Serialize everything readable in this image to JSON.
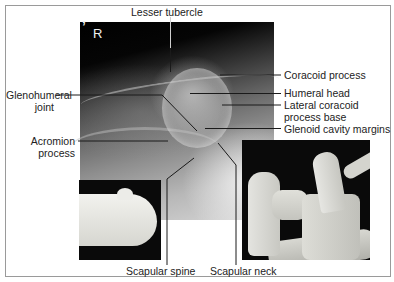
{
  "figure": {
    "type": "anatomical-radiograph-diagram",
    "side_marker": "R",
    "corner_mark": "’",
    "labels": {
      "top": [
        {
          "id": "lesser-tubercle",
          "text": "Lesser tubercle"
        }
      ],
      "left": [
        {
          "id": "glenohumeral-joint",
          "lines": [
            "Glenohumeral",
            "joint"
          ]
        },
        {
          "id": "acromion-process",
          "lines": [
            "Acromion",
            "process"
          ]
        }
      ],
      "right": [
        {
          "id": "coracoid-process",
          "text": "Coracoid process"
        },
        {
          "id": "humeral-head",
          "text": "Humeral head"
        },
        {
          "id": "lateral-coracoid-process-base",
          "lines": [
            "Lateral coracoid",
            "process base"
          ]
        },
        {
          "id": "glenoid-cavity-margins",
          "text": "Glenoid cavity margins"
        }
      ],
      "bottom": [
        {
          "id": "scapular-spine",
          "text": "Scapular spine"
        },
        {
          "id": "scapular-neck",
          "text": "Scapular neck"
        }
      ]
    },
    "insets": [
      {
        "id": "proximal-humerus-specimen",
        "description": "bone specimen photo of proximal humerus"
      },
      {
        "id": "scapula-humerus-specimen",
        "description": "bone specimen photo of shoulder joint"
      }
    ],
    "colors": {
      "frame_border": "#9a9a9a",
      "leader_line": "#1a1a1a",
      "label_text": "#222222",
      "background": "#ffffff"
    }
  }
}
